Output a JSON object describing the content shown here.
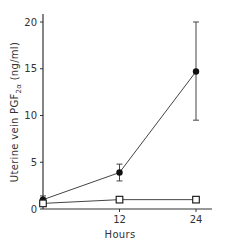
{
  "chart_data": {
    "type": "line",
    "title": "",
    "xlabel": "Hours",
    "ylabel": "Uterine vein PGF2α (ng/ml)",
    "ylabel_parts": {
      "pre": "Uterine vein PGF",
      "sub": "2α",
      "post": " (ng/ml)"
    },
    "x": [
      0,
      12,
      24
    ],
    "x_ticks": [
      "12",
      "24"
    ],
    "y_ticks": [
      "0",
      "5",
      "10",
      "15",
      "20"
    ],
    "xlim": [
      0,
      26
    ],
    "ylim": [
      0,
      21
    ],
    "grid": false,
    "legend": "none",
    "series": [
      {
        "name": "filled circles",
        "marker": "filled-circle",
        "values": [
          1.0,
          3.9,
          14.7
        ],
        "err_low": [
          0.6,
          3.0,
          9.5
        ],
        "err_high": [
          1.4,
          4.8,
          20.0
        ]
      },
      {
        "name": "open squares",
        "marker": "open-square",
        "values": [
          0.6,
          1.0,
          1.0
        ],
        "err_low": [
          0.4,
          0.9,
          0.9
        ],
        "err_high": [
          0.8,
          1.1,
          1.1
        ]
      }
    ]
  }
}
